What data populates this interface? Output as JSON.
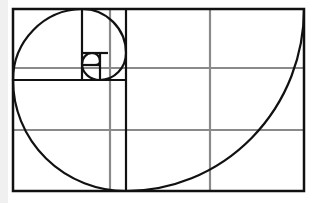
{
  "diagram": {
    "colors": {
      "background": "#ffffff",
      "left_strip": "#f0f0f0",
      "spiral": "#111111",
      "golden_rectangles": "#111111",
      "thirds_grid": "#8a8a8a"
    },
    "frame": {
      "x": 13,
      "y": 9,
      "width": 291,
      "height": 182
    },
    "thirds_grid": {
      "vertical_x": [
        110,
        210
      ],
      "horizontal_y": [
        68,
        130
      ]
    },
    "golden_divisions": [
      {
        "x1": 126,
        "y1": 9,
        "x2": 126,
        "y2": 191
      },
      {
        "x1": 13,
        "y1": 80,
        "x2": 126,
        "y2": 80
      },
      {
        "x1": 82,
        "y1": 9,
        "x2": 82,
        "y2": 80
      },
      {
        "x1": 82,
        "y1": 53,
        "x2": 108,
        "y2": 53
      },
      {
        "x1": 100,
        "y1": 53,
        "x2": 100,
        "y2": 80
      },
      {
        "x1": 82,
        "y1": 65,
        "x2": 100,
        "y2": 65
      }
    ],
    "spiral_path": "M 304 9 A 178 182 0 0 1 126 191 A 113 111 0 0 1 13 80 A 70 71 0 0 1 82 9 A 44 44 0 0 1 126 53 A 26 27 0 0 1 100 80 A 18 16 0 0 1 82 64 A 10 11 0 0 1 92 53 A 8 8 0 0 1 100 61 A 5 4 0 0 1 95 65"
  }
}
